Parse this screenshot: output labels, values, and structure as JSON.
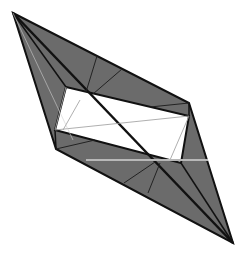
{
  "diagram": {
    "type": "folded-paper-crease-diagram",
    "colors": {
      "background": "#ffffff",
      "shaded_fill": "#6b6b6b",
      "outline": "#111111",
      "thin_crease": "#333333",
      "inner_crease": "#9a9a9a",
      "highlight_line": "#b8b8b8"
    },
    "vertices": {
      "top_left_tip": [
        13,
        13
      ],
      "right_vertex": [
        189,
        103
      ],
      "left_vertex": [
        56,
        149
      ],
      "bottom_right_tip": [
        233,
        243
      ],
      "inner_top_left": [
        66,
        87
      ],
      "inner_top_right": [
        189,
        116
      ],
      "inner_bottom_left": [
        55,
        130
      ],
      "inner_bottom_right": [
        181,
        163
      ]
    },
    "labels": []
  }
}
